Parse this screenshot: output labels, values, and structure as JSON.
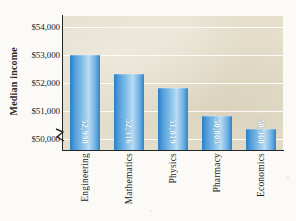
{
  "chart_data": {
    "type": "bar",
    "title": "",
    "xlabel": "",
    "ylabel": "Median income",
    "categories": [
      "Engineering",
      "Mathematics",
      "Physics",
      "Pharmacy",
      "Economics"
    ],
    "values": [
      52998,
      52316,
      51819,
      50805,
      50360
    ],
    "value_labels": [
      "52,998",
      "52,316",
      "51,819",
      "50,805",
      "50,360"
    ],
    "ytick_labels": [
      "$50,000",
      "$51,000",
      "$52,000",
      "$53,000",
      "$54,000"
    ],
    "ytick_values": [
      50000,
      51000,
      52000,
      53000,
      54000
    ],
    "ylim": [
      49600,
      54400
    ],
    "axis_break": true,
    "grid": true,
    "legend": "none",
    "colors": {
      "bar_light": "#b9dcf4",
      "bar_mid": "#6fb0e2",
      "bar_dark": "#2a7fc4",
      "plot_background": "#e4decb",
      "gridline": "#fdfdf8",
      "axis": "#262626",
      "page_background": "#fbfaf7",
      "value_label": "#ffffff"
    }
  }
}
